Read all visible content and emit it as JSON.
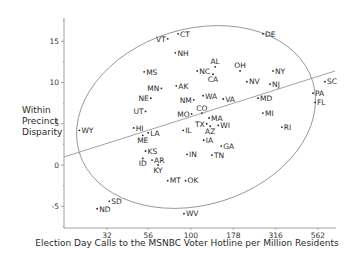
{
  "chart_data": {
    "type": "scatter",
    "title": "",
    "xlabel": "Election Day Calls to the MSNBC Voter Hotline per Million Residents",
    "ylabel": "Within Precinct Disparity",
    "x_scale": "log",
    "x_ticks": [
      32,
      56,
      100,
      178,
      316,
      562
    ],
    "y_ticks": [
      -5,
      0,
      5,
      10,
      15
    ],
    "ylim": [
      -7,
      17
    ],
    "grid": false,
    "legend": null,
    "annotations": [
      "linear fit line",
      "confidence ellipse"
    ],
    "points": [
      {
        "label": "WY",
        "x": 22,
        "y": 4.2
      },
      {
        "label": "VT",
        "x": 73,
        "y": 15.3
      },
      {
        "label": "CT",
        "x": 84,
        "y": 15.9
      },
      {
        "label": "DE",
        "x": 266,
        "y": 15.9
      },
      {
        "label": "NH",
        "x": 81,
        "y": 13.6
      },
      {
        "label": "MS",
        "x": 53,
        "y": 11.3
      },
      {
        "label": "NC",
        "x": 109,
        "y": 11.4
      },
      {
        "label": "AL",
        "x": 139,
        "y": 11.9
      },
      {
        "label": "CA",
        "x": 135,
        "y": 11.0
      },
      {
        "label": "OH",
        "x": 195,
        "y": 11.4
      },
      {
        "label": "NY",
        "x": 305,
        "y": 11.4
      },
      {
        "label": "AK",
        "x": 82,
        "y": 9.6
      },
      {
        "label": "MN",
        "x": 67,
        "y": 9.3
      },
      {
        "label": "NE",
        "x": 58,
        "y": 8.1
      },
      {
        "label": "NV",
        "x": 214,
        "y": 10.1
      },
      {
        "label": "NJ",
        "x": 293,
        "y": 9.8
      },
      {
        "label": "SC",
        "x": 618,
        "y": 10.1
      },
      {
        "label": "PA",
        "x": 525,
        "y": 8.7
      },
      {
        "label": "FL",
        "x": 540,
        "y": 7.6
      },
      {
        "label": "WA",
        "x": 118,
        "y": 8.4
      },
      {
        "label": "NM",
        "x": 104,
        "y": 7.9
      },
      {
        "label": "VA",
        "x": 155,
        "y": 8.0
      },
      {
        "label": "MD",
        "x": 249,
        "y": 8.1
      },
      {
        "label": "UT",
        "x": 54,
        "y": 6.5
      },
      {
        "label": "MO",
        "x": 101,
        "y": 6.2
      },
      {
        "label": "CO",
        "x": 116,
        "y": 6.3
      },
      {
        "label": "MA",
        "x": 128,
        "y": 5.7
      },
      {
        "label": "MI",
        "x": 266,
        "y": 6.3
      },
      {
        "label": "TX",
        "x": 124,
        "y": 5.0
      },
      {
        "label": "AZ",
        "x": 130,
        "y": 4.7
      },
      {
        "label": "WI",
        "x": 145,
        "y": 4.8
      },
      {
        "label": "RI",
        "x": 344,
        "y": 4.6
      },
      {
        "label": "HI",
        "x": 46,
        "y": 4.5
      },
      {
        "label": "ME",
        "x": 52,
        "y": 3.6
      },
      {
        "label": "LA",
        "x": 56,
        "y": 3.9
      },
      {
        "label": "IL",
        "x": 90,
        "y": 4.2
      },
      {
        "label": "IA",
        "x": 119,
        "y": 3.0
      },
      {
        "label": "GA",
        "x": 151,
        "y": 2.3
      },
      {
        "label": "KS",
        "x": 54,
        "y": 1.7
      },
      {
        "label": "IN",
        "x": 95,
        "y": 1.3
      },
      {
        "label": "TN",
        "x": 133,
        "y": 1.2
      },
      {
        "label": "ID",
        "x": 52,
        "y": 0.8
      },
      {
        "label": "AR",
        "x": 59,
        "y": 0.6
      },
      {
        "label": "KY",
        "x": 64,
        "y": 0.0
      },
      {
        "label": "MT",
        "x": 73,
        "y": -1.9
      },
      {
        "label": "OK",
        "x": 93,
        "y": -1.9
      },
      {
        "label": "SD",
        "x": 33,
        "y": -4.4
      },
      {
        "label": "ND",
        "x": 28,
        "y": -5.3
      },
      {
        "label": "WV",
        "x": 91,
        "y": -5.9
      }
    ]
  },
  "labels": {
    "ylabel_line1": "Within",
    "ylabel_line2": "Precinct",
    "ylabel_line3": "Disparity",
    "xlabel": "Election Day Calls to the MSNBC Voter Hotline per Million Residents"
  }
}
